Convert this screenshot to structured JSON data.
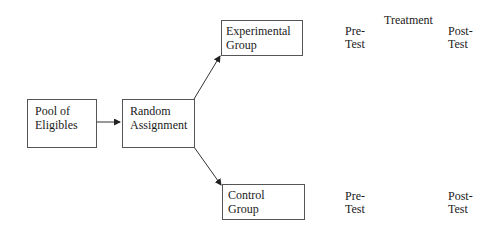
{
  "diagram": {
    "nodes": {
      "pool": {
        "line1": "Pool of",
        "line2": "Eligibles"
      },
      "random": {
        "line1": "Random",
        "line2": "Assignment"
      },
      "experimental": {
        "line1": "Experimental",
        "line2": "Group"
      },
      "control": {
        "line1": "Control",
        "line2": "Group"
      }
    },
    "labels": {
      "treatment": "Treatment",
      "exp_pre": {
        "line1": "Pre-",
        "line2": "Test"
      },
      "exp_post": {
        "line1": "Post-",
        "line2": "Test"
      },
      "ctl_pre": {
        "line1": "Pre-",
        "line2": "Test"
      },
      "ctl_post": {
        "line1": "Post-",
        "line2": "Test"
      }
    },
    "edges": [
      {
        "from": "pool",
        "to": "random"
      },
      {
        "from": "random",
        "to": "experimental"
      },
      {
        "from": "random",
        "to": "control"
      }
    ]
  }
}
